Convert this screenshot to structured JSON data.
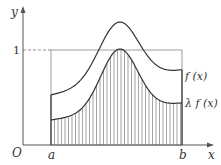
{
  "axes": {
    "x_label": "x",
    "y_label": "y",
    "origin_label": "O",
    "y_tick_label": "1"
  },
  "points": {
    "a_label": "a",
    "b_label": "b"
  },
  "curves": {
    "upper_label": "f (x)",
    "lower_label": "λ f (x)"
  },
  "colors": {
    "stroke": "#333333",
    "axis": "#555555",
    "hatch": "#666666",
    "box": "#888888"
  }
}
